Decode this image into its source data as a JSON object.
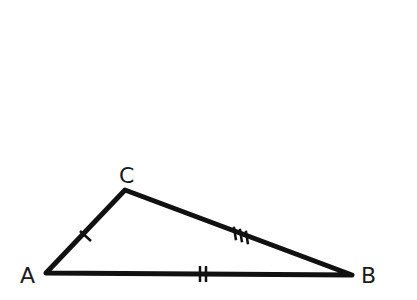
{
  "diagram": {
    "type": "triangle",
    "vertices": {
      "A": {
        "label": "A",
        "x": 46,
        "y": 273
      },
      "B": {
        "label": "B",
        "x": 352,
        "y": 275
      },
      "C": {
        "label": "C",
        "x": 125,
        "y": 190
      }
    },
    "sides": [
      {
        "name": "AC",
        "tick_marks": 1
      },
      {
        "name": "AB",
        "tick_marks": 2
      },
      {
        "name": "CB",
        "tick_marks": 3
      }
    ],
    "colors": {
      "stroke": "#111111",
      "background": "#ffffff"
    }
  }
}
